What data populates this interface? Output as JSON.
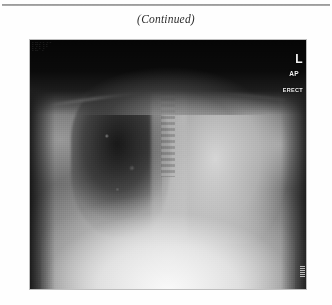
{
  "page": {
    "caption": "(Continued)",
    "has_top_rule": true,
    "background_color": "#ffffff"
  },
  "figure": {
    "type": "radiograph",
    "modality_label": "chest-xray",
    "projection": "AP",
    "patient_position": "ERECT",
    "laterality_marker": "L",
    "markers": [
      {
        "name": "laterality-marker",
        "text": "L"
      },
      {
        "name": "projection-marker",
        "text": "AP"
      },
      {
        "name": "position-marker",
        "text": "ERECT"
      }
    ],
    "film_metadata_lines": [
      "________ ____",
      "____ __ ____",
      "__ ___ _____",
      "___ __ __",
      "_____ ___"
    ],
    "colors": {
      "film_base": "#6a6a6a",
      "collimation": "#050505",
      "marker_text": "#f2f2f2",
      "bright_field": "#fafafa"
    }
  }
}
